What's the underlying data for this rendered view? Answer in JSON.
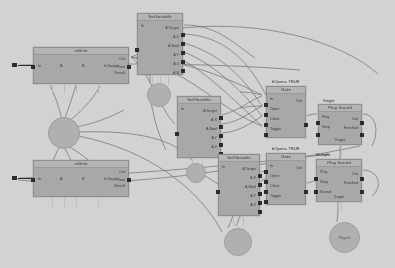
{
  "app": {
    "title": "Node Graph Editor",
    "background_color": "#d2d2d2",
    "node_color": "#a8a8a8",
    "node_title_color": "#b4b4b4",
    "port_color": "#2c2c2c",
    "wire_color": "#6f6f6f",
    "hub_color": "#b0b0b0"
  },
  "group_labels": [
    {
      "name": "group-bopen-true-top",
      "text": "bOpen= TRUE",
      "x": 272,
      "y": 79
    },
    {
      "name": "group-single",
      "text": "Single",
      "x": 323,
      "y": 98
    },
    {
      "name": "group-bopen-true-bottom",
      "text": "bOpen= TRUE",
      "x": 272,
      "y": 146
    },
    {
      "name": "group-multiple",
      "text": "Multiple",
      "x": 316,
      "y": 152
    }
  ],
  "nodes": [
    {
      "name": "node-ashint-top",
      "title": "aShint",
      "x": 33,
      "y": 47,
      "w": 96,
      "h": 37,
      "left_labels": [
        "In",
        "A",
        "B",
        "InTarget"
      ],
      "right_labels": [
        "Out",
        "Float",
        "Result"
      ],
      "left_ports": [
        {
          "y": 10
        }
      ],
      "right_ports": [
        {
          "y": 10
        }
      ],
      "bottom_stubs": [
        18,
        30,
        42,
        64
      ]
    },
    {
      "name": "node-setvariable-top",
      "title": "SetVariable",
      "x": 137,
      "y": 13,
      "w": 46,
      "h": 62,
      "left_labels": [
        "In"
      ],
      "right_labels": [
        "A Target",
        "A X",
        "A Bool",
        "A Y",
        "A Z",
        "A B"
      ],
      "left_ports": [
        {
          "y": 27
        }
      ],
      "right_ports": [
        {
          "y": 12
        },
        {
          "y": 21
        },
        {
          "y": 30
        },
        {
          "y": 39
        },
        {
          "y": 48
        }
      ],
      "bottom_stubs": [
        14,
        22,
        30
      ]
    },
    {
      "name": "node-setvariable-mid",
      "title": "SetVariable",
      "x": 177,
      "y": 96,
      "w": 44,
      "h": 62,
      "left_labels": [
        "In"
      ],
      "right_labels": [
        "A Target",
        "A X",
        "A Bool",
        "A Y",
        "A Z"
      ],
      "left_ports": [
        {
          "y": 28
        }
      ],
      "right_ports": [
        {
          "y": 12
        },
        {
          "y": 21
        },
        {
          "y": 30
        },
        {
          "y": 39
        },
        {
          "y": 48
        }
      ],
      "bottom_stubs": [
        14,
        24
      ]
    },
    {
      "name": "node-setvariable-low",
      "title": "SetVariable",
      "x": 218,
      "y": 154,
      "w": 42,
      "h": 62,
      "left_labels": [
        "In"
      ],
      "right_labels": [
        "A Target",
        "A X",
        "A Bool",
        "A Y",
        "A Z"
      ],
      "left_ports": [
        {
          "y": 28
        }
      ],
      "right_ports": [
        {
          "y": 12
        },
        {
          "y": 21
        },
        {
          "y": 30
        },
        {
          "y": 39
        },
        {
          "y": 48
        }
      ],
      "bottom_stubs": [
        14,
        24
      ]
    },
    {
      "name": "node-ashint-bottom",
      "title": "aShint",
      "x": 33,
      "y": 160,
      "w": 96,
      "h": 37,
      "left_labels": [
        "In",
        "A",
        "B",
        "InTarget"
      ],
      "right_labels": [
        "Out",
        "Float",
        "Result"
      ],
      "left_ports": [
        {
          "y": 10
        }
      ],
      "right_ports": [
        {
          "y": 10
        }
      ],
      "bottom_stubs": [
        18,
        30,
        42,
        64
      ]
    },
    {
      "name": "node-gate-top",
      "title": "Gate",
      "x": 266,
      "y": 86,
      "w": 40,
      "h": 52,
      "left_labels": [
        "In",
        "Open",
        "Close",
        "Toggle"
      ],
      "right_labels": [
        "Out"
      ],
      "left_ports": [
        {
          "y": 9
        },
        {
          "y": 19
        },
        {
          "y": 29
        },
        {
          "y": 39
        }
      ],
      "right_ports": [
        {
          "y": 29
        }
      ],
      "bottom_stubs": []
    },
    {
      "name": "node-gate-bottom",
      "title": "Gate",
      "x": 266,
      "y": 153,
      "w": 40,
      "h": 52,
      "left_labels": [
        "In",
        "Open",
        "Close",
        "Toggle"
      ],
      "right_labels": [
        "Out"
      ],
      "left_ports": [
        {
          "y": 9
        },
        {
          "y": 19
        },
        {
          "y": 29
        },
        {
          "y": 39
        }
      ],
      "right_ports": [
        {
          "y": 29
        }
      ],
      "bottom_stubs": []
    },
    {
      "name": "node-playsound-single",
      "title": "Play Sound",
      "x": 318,
      "y": 104,
      "w": 44,
      "h": 41,
      "left_labels": [
        "Play",
        "Stop"
      ],
      "right_labels": [
        "Out",
        "Finished"
      ],
      "left_ports": [
        {
          "y": 9
        },
        {
          "y": 21
        }
      ],
      "right_ports": [
        {
          "y": 9
        },
        {
          "y": 21
        }
      ],
      "bottom_stubs": [
        22
      ],
      "footer": "Target"
    },
    {
      "name": "node-playsound-multiple",
      "title": "Play Sound",
      "x": 316,
      "y": 159,
      "w": 46,
      "h": 43,
      "left_labels": [
        "Play",
        "Stop",
        "Sound"
      ],
      "right_labels": [
        "Out",
        "Finished"
      ],
      "left_ports": [
        {
          "y": 10
        },
        {
          "y": 23
        }
      ],
      "right_ports": [
        {
          "y": 10
        },
        {
          "y": 23
        }
      ],
      "bottom_stubs": [
        24
      ],
      "footer": "Target"
    }
  ],
  "hubs": [
    {
      "name": "hub-left-main",
      "label": "",
      "x": 48,
      "y": 117,
      "d": 30
    },
    {
      "name": "hub-top-mid",
      "label": "",
      "x": 147,
      "y": 83,
      "d": 22
    },
    {
      "name": "hub-mid-lower",
      "label": "",
      "x": 186,
      "y": 163,
      "d": 18
    },
    {
      "name": "hub-bottom-mid",
      "label": "",
      "x": 224,
      "y": 228,
      "d": 26
    },
    {
      "name": "hub-player",
      "label": "Player1",
      "x": 329,
      "y": 222,
      "d": 29
    }
  ],
  "external_ports": [
    {
      "name": "ext-port-in-top",
      "x": 12,
      "y": 63,
      "lead_x": 18,
      "lead_y": 65,
      "lead_w": 16
    },
    {
      "name": "ext-port-in-bottom",
      "x": 12,
      "y": 176,
      "lead_x": 18,
      "lead_y": 178,
      "lead_w": 16
    }
  ],
  "wires": [
    {
      "name": "wire-ashint-to-setvar-top",
      "d": "M131,57 C146,52 140,44 139,41"
    },
    {
      "name": "wire-ashint-to-gate-top",
      "d": "M131,57 C180,60 215,72 262,95"
    },
    {
      "name": "wire-ashint-to-gate-lower",
      "d": "M131,57 C190,70 220,110 262,126"
    },
    {
      "name": "wire-ashint-to-setvar-mid",
      "d": "M131,57 C150,72 160,110 175,124"
    },
    {
      "name": "wire-setvar-top-out-a",
      "d": "M184,25 C215,25 230,40 255,58"
    },
    {
      "name": "wire-setvar-top-out-b",
      "d": "M184,34 C220,36 245,55 266,95"
    },
    {
      "name": "wire-setvar-top-out-c",
      "d": "M184,43 C215,52 240,72 262,106"
    },
    {
      "name": "wire-setvar-top-out-d",
      "d": "M184,52 C210,62 240,88 262,116"
    },
    {
      "name": "wire-setvar-top-out-e",
      "d": "M184,61 C205,72 230,96 262,126"
    },
    {
      "name": "wire-setvar-mid-out-a",
      "d": "M222,115 C240,110 250,100 262,96"
    },
    {
      "name": "wire-setvar-mid-out-b",
      "d": "M222,124 C240,122 250,112 262,106"
    },
    {
      "name": "wire-setvar-mid-out-c",
      "d": "M222,133 C238,132 250,124 262,116"
    },
    {
      "name": "wire-setvar-low-out-a",
      "d": "M261,172 C272,170 276,168 282,166"
    },
    {
      "name": "wire-setvar-low-out-b",
      "d": "M261,181 C272,176 276,172 282,170"
    },
    {
      "name": "wire-gate-top-out",
      "d": "M307,116 C312,114 314,114 317,114"
    },
    {
      "name": "wire-gate-bot-out",
      "d": "M307,183 C312,182 314,181 316,180"
    },
    {
      "name": "wire-playsound-s-out",
      "d": "M363,114 C375,114 380,130 372,146"
    },
    {
      "name": "wire-playsound-m-out",
      "d": "M363,170 C378,170 384,186 372,196"
    },
    {
      "name": "wire-hub-to-ashint-a",
      "d": "M62,120 C58,102 52,90 50,85"
    },
    {
      "name": "wire-hub-to-ashint-b",
      "d": "M64,121 C70,104 74,92 76,85"
    },
    {
      "name": "wire-hub-to-ashint-c",
      "d": "M68,122 C86,108 96,94 100,86"
    },
    {
      "name": "wire-hub-to-ashint-d",
      "d": "M70,128 C96,124 112,116 124,110"
    },
    {
      "name": "wire-hub-to-ashint-low-a",
      "d": "M60,146 C54,156 52,164 51,170"
    },
    {
      "name": "wire-hub-to-ashint-low-b",
      "d": "M64,147 C70,158 74,166 76,172"
    },
    {
      "name": "wire-hub-to-ashint-low-c",
      "d": "M68,146 C88,158 96,166 100,174"
    },
    {
      "name": "wire-hub-long-right",
      "d": "M78,132 C140,130 175,140 192,160"
    },
    {
      "name": "wire-hub-long-right-2",
      "d": "M78,136 C150,150 200,190 222,232"
    },
    {
      "name": "wire-hubmid-down",
      "d": "M150,94 C152,110 156,130 166,150"
    },
    {
      "name": "wire-hubmid-up",
      "d": "M150,83 C150,72 150,64 150,58"
    },
    {
      "name": "wire-hubmidlow-right",
      "d": "M195,170 C205,176 212,180 218,184"
    },
    {
      "name": "wire-hubbot-to-setvar",
      "d": "M228,228 C232,220 234,212 236,205"
    },
    {
      "name": "wire-hubbot-to-setvar-2",
      "d": "M236,226 C240,216 243,210 246,204"
    },
    {
      "name": "wire-player-up",
      "d": "M337,222 C338,214 338,208 338,202"
    },
    {
      "name": "wire-flat-left-top",
      "d": "M20,65 C100,64 200,62 300,70"
    },
    {
      "name": "wire-flat-left-bottom",
      "d": "M20,178 C120,176 230,166 330,154"
    },
    {
      "name": "wire-cross-long",
      "d": "M18,180 C120,190 240,170 360,146"
    },
    {
      "name": "wire-edge-right-top",
      "d": "M183,28 C260,20 340,40 378,74"
    },
    {
      "name": "wire-gate-top-in-1",
      "d": "M240,92 C250,92 256,94 262,95"
    },
    {
      "name": "wire-gate-top-in-2",
      "d": "M240,108 C250,106 256,106 262,106"
    },
    {
      "name": "wire-ps-single-target",
      "d": "M340,146 C340,152 340,156 340,160"
    }
  ]
}
